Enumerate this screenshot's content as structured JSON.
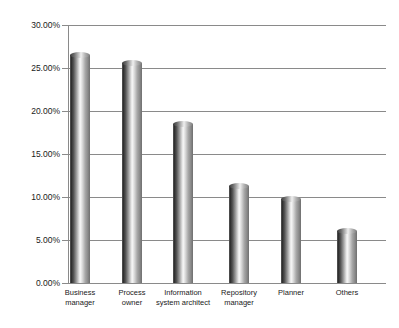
{
  "chart_data": {
    "type": "bar",
    "title": "",
    "xlabel": "",
    "ylabel": "",
    "categories": [
      "Business manager",
      "Process owner",
      "Information system architect",
      "Repository manager",
      "Planner",
      "Others"
    ],
    "category_labels_wrapped": [
      "Business\nmanager",
      "Process\nowner",
      "Information\nsystem architect",
      "Repository\nmanager",
      "Planner",
      "Others"
    ],
    "values": [
      26.5,
      25.6,
      18.5,
      11.3,
      9.8,
      6.0
    ],
    "value_labels": [
      "26.50%",
      "25.60%",
      "18.50%",
      "11.30%",
      "9.80%",
      "6.00%"
    ],
    "ylim": [
      0,
      30
    ],
    "ytick_values": [
      0,
      5,
      10,
      15,
      20,
      25,
      30
    ],
    "ytick_labels": [
      "0.00%",
      "5.00%",
      "10.00%",
      "15.00%",
      "20.00%",
      "25.00%",
      "30.00%"
    ],
    "grid": true,
    "legend": false,
    "legend_position": "none",
    "bar_style": "cylinder",
    "colors": {
      "bar_dark": "#2e2e2e",
      "bar_light": "#f4f4f4",
      "gridline": "#8a8a8a",
      "axis": "#8a8a8a",
      "text": "#1a1a1a",
      "background": "#ffffff"
    }
  }
}
